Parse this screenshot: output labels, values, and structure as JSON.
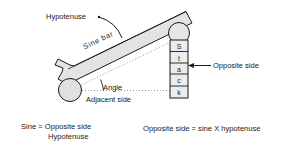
{
  "diagram": {
    "title_labels": {
      "hypotenuse": "Hypotenuse",
      "sine_bar": "Sine bar",
      "angle": "Angle",
      "adjacent_side": "Adjacent side",
      "opposite_side": "Opposite side"
    },
    "stack": {
      "label": "Stack",
      "letters": [
        "S",
        "t",
        "a",
        "c",
        "k"
      ]
    },
    "formulas": {
      "left": {
        "lhs": "Sine  =  Opposite side",
        "denominator": "Hypotenuse"
      },
      "right": "Opposite side  =  sine  X  hypotenuse"
    },
    "colors": {
      "ink": "#1a1a1a",
      "bar_fill": "#e3e3e3",
      "bar_stroke": "#1a1a1a",
      "roller_fill": "#e0e0e0",
      "stack_fill": "#ececec",
      "dotted": "#9a9a9a",
      "background": "#ffffff"
    }
  }
}
